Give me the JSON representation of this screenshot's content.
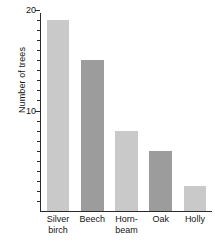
{
  "chart_data": {
    "type": "bar",
    "title": "",
    "subtitle": "",
    "xlabel": "",
    "ylabel": "Number of trees",
    "categories": [
      "Silver birch",
      "Beech",
      "Hornbeam",
      "Oak",
      "Holly"
    ],
    "category_lines": [
      [
        "Silver",
        "birch"
      ],
      [
        "Beech",
        ""
      ],
      [
        "Horn-",
        "beam"
      ],
      [
        "Oak",
        ""
      ],
      [
        "Holly",
        ""
      ]
    ],
    "values": [
      19,
      15,
      8,
      6,
      2.5
    ],
    "bar_colors": [
      "#c9c9c9",
      "#9c9c9c",
      "#c9c9c9",
      "#9c9c9c",
      "#c9c9c9"
    ],
    "ylim": [
      0,
      20
    ],
    "y_tick_labels": [
      "10",
      "20"
    ],
    "y_tick_values": [
      10,
      20
    ],
    "y_minor_tick_step": 1,
    "grid": false,
    "legend": "none",
    "axis_color": "#2b2b2b"
  }
}
